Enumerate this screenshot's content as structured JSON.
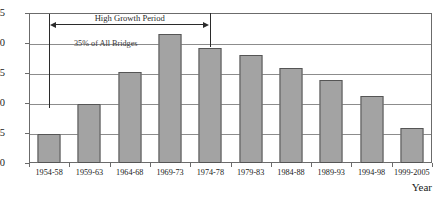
{
  "top_remnant_text": "",
  "chart_data": {
    "type": "bar",
    "title": "",
    "xlabel": "Year",
    "ylabel": "",
    "ylim": [
      0,
      25
    ],
    "yticks": [
      0,
      5,
      10,
      15,
      20,
      25
    ],
    "grid": true,
    "legend": "none",
    "categories": [
      "1954-58",
      "1959-63",
      "1964-68",
      "1969-73",
      "1974-78",
      "1979-83",
      "1984-88",
      "1989-93",
      "1994-98",
      "1999-2005"
    ],
    "values": [
      4.8,
      9.8,
      15.2,
      21.5,
      19.1,
      18.0,
      15.9,
      13.9,
      11.2,
      5.8
    ],
    "bar_color": "#a3a3a3",
    "bar_edge_color": "#555555",
    "annotations": [
      {
        "id": "high-growth",
        "text": "High Growth Period",
        "span_start_category": "1954-58",
        "span_end_category": "1974-78"
      },
      {
        "id": "share",
        "text": "35% of All Bridges"
      }
    ]
  }
}
